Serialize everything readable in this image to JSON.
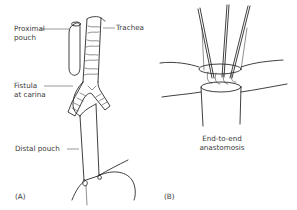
{
  "figure": {
    "panel_a": {
      "tag": "(A)",
      "labels": {
        "proximal_pouch_line1": "Proximal",
        "proximal_pouch_line2": "pouch",
        "trachea": "Trachea",
        "fistula_line1": "Fistula",
        "fistula_line2": "at carina",
        "distal_pouch": "Distal pouch"
      }
    },
    "panel_b": {
      "tag": "(B)",
      "caption_line1": "End-to-end",
      "caption_line2": "anastomosis"
    },
    "colors": {
      "line": "#2a2a2a",
      "text": "#3a3a3a",
      "background": "#ffffff"
    }
  }
}
